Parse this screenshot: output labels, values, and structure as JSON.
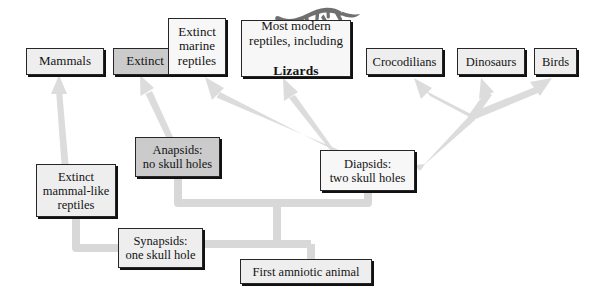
{
  "diagram": {
    "line_color": "#d8d8d8",
    "box_border_color": "#262626",
    "shadow_color": "#111111",
    "fills": {
      "light": "#eeeeee",
      "mid": "#cbcbcb",
      "white": "#f7f7f7"
    },
    "illustration": {
      "name": "lizard-silhouette",
      "color": "#6f6f6f"
    }
  },
  "nodes": [
    {
      "id": "mammals",
      "label": "Mammals",
      "x": 26,
      "y": 48,
      "w": 78,
      "h": 27,
      "fill": "light",
      "fs": 13
    },
    {
      "id": "extinct",
      "label": "Extinct",
      "x": 113,
      "y": 48,
      "w": 64,
      "h": 27,
      "fill": "mid",
      "fs": 13
    },
    {
      "id": "extinct-marine",
      "label": "Extinct\nmarine\nreptiles",
      "x": 168,
      "y": 18,
      "w": 58,
      "h": 57,
      "fill": "white",
      "fs": 13
    },
    {
      "id": "modern-reptiles",
      "label": "Most modern\nreptiles, including",
      "x": 241,
      "y": 20,
      "w": 110,
      "h": 57,
      "fill": "white",
      "fs": 13,
      "bold_tail": "Lizards"
    },
    {
      "id": "crocodilians",
      "label": "Crocodilians",
      "x": 366,
      "y": 48,
      "w": 77,
      "h": 27,
      "fill": "light",
      "fs": 12.5
    },
    {
      "id": "dinosaurs",
      "label": "Dinosaurs",
      "x": 457,
      "y": 48,
      "w": 68,
      "h": 27,
      "fill": "light",
      "fs": 12.5
    },
    {
      "id": "birds",
      "label": "Birds",
      "x": 534,
      "y": 48,
      "w": 43,
      "h": 27,
      "fill": "light",
      "fs": 12.5
    },
    {
      "id": "anapsids",
      "label": "Anapsids:\nno skull holes",
      "x": 135,
      "y": 137,
      "w": 85,
      "h": 40,
      "fill": "mid",
      "fs": 12.5
    },
    {
      "id": "diapsids",
      "label": "Diapsids:\ntwo skull holes",
      "x": 320,
      "y": 150,
      "w": 95,
      "h": 41,
      "fill": "white",
      "fs": 12.5
    },
    {
      "id": "extinct-mammal",
      "label": "Extinct\nmammal-like\nreptiles",
      "x": 36,
      "y": 164,
      "w": 80,
      "h": 53,
      "fill": "light",
      "fs": 12.5
    },
    {
      "id": "synapsids",
      "label": "Synapsids:\none skull hole",
      "x": 118,
      "y": 228,
      "w": 85,
      "h": 40,
      "fill": "light",
      "fs": 12.5
    },
    {
      "id": "first-amniotic",
      "label": "First amniotic animal",
      "x": 240,
      "y": 259,
      "w": 132,
      "h": 25,
      "fill": "light",
      "fs": 12.5
    }
  ],
  "arrows": [
    {
      "id": "arrow-extinct-mammal-to-mammals",
      "from": "extinct-mammal",
      "to": "mammals"
    },
    {
      "id": "arrow-anapsids-to-extinct",
      "from": "anapsids",
      "to": "extinct"
    },
    {
      "id": "arrow-diapsids-to-extinct-marine",
      "from": "diapsids",
      "to": "extinct-marine"
    },
    {
      "id": "arrow-diapsids-to-modern",
      "from": "diapsids",
      "to": "modern-reptiles"
    },
    {
      "id": "arrow-diapsids-to-crocodilians",
      "from": "diapsids",
      "to": "crocodilians"
    },
    {
      "id": "arrow-diapsids-to-dinosaurs",
      "from": "diapsids",
      "to": "dinosaurs"
    },
    {
      "id": "arrow-diapsids-to-birds",
      "from": "diapsids",
      "to": "birds"
    }
  ],
  "connectors": [
    {
      "id": "connector-anapsids-stem",
      "desc": "Anapsids down to backbone"
    },
    {
      "id": "connector-diapsids-stem",
      "desc": "Diapsids down to backbone"
    },
    {
      "id": "connector-backbone-upper",
      "desc": "Horizontal bar joining anapsids and diapsids"
    },
    {
      "id": "connector-trunk",
      "desc": "Vertical trunk to lower bar"
    },
    {
      "id": "connector-backbone-lower",
      "desc": "Horizontal bar joining synapsids and first amniotic animal"
    },
    {
      "id": "connector-synapsids-left",
      "desc": "Synapsids left to extinct mammal-like reptiles"
    },
    {
      "id": "connector-amniotic-stem",
      "desc": "First amniotic animal up to lower bar"
    }
  ]
}
